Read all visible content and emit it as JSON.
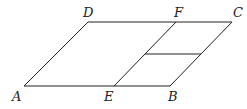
{
  "diagram": {
    "type": "parallelogram",
    "points": {
      "A": [
        24,
        86
      ],
      "B": [
        170,
        86
      ],
      "C": [
        232,
        22
      ],
      "D": [
        88,
        22
      ],
      "E": [
        114,
        86
      ],
      "F": [
        176,
        22
      ],
      "G": [
        145,
        54
      ],
      "H": [
        201,
        54
      ]
    },
    "labels": [
      {
        "text": "A",
        "x": 12,
        "y": 101
      },
      {
        "text": "E",
        "x": 104,
        "y": 101
      },
      {
        "text": "B",
        "x": 168,
        "y": 101
      },
      {
        "text": "D",
        "x": 83,
        "y": 17
      },
      {
        "text": "F",
        "x": 174,
        "y": 17
      },
      {
        "text": "C",
        "x": 233,
        "y": 17
      }
    ],
    "segments": [
      [
        "A",
        "B"
      ],
      [
        "B",
        "C"
      ],
      [
        "C",
        "D"
      ],
      [
        "D",
        "A"
      ],
      [
        "E",
        "F"
      ],
      [
        "G",
        "H"
      ]
    ]
  }
}
